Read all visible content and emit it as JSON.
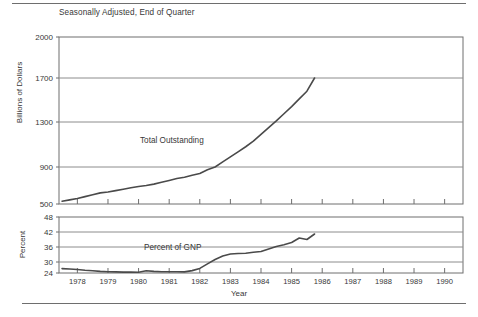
{
  "figure": {
    "subtitle": "Seasonally Adjusted, End of Quarter",
    "xlabel": "Year",
    "ylabel_top": "Billions of Dollars",
    "ylabel_bottom": "Percent",
    "line_color": "#4a4a4a",
    "axis_color": "#6e6e6e",
    "grid_color": "#8c8c8c",
    "text_color": "#383838"
  },
  "chart_data": [
    {
      "type": "line",
      "title": "Seasonally Adjusted, End of Quarter",
      "xlabel": "Year",
      "ylabel": "Billions of Dollars",
      "grid": true,
      "legend": "none",
      "annotations": [
        "Total Outstanding"
      ],
      "series_label": "Total Outstanding",
      "xlim": [
        1977.4,
        1990.6
      ],
      "xticks": [
        1978,
        1979,
        1980,
        1981,
        1982,
        1983,
        1984,
        1985,
        1986,
        1987,
        1988,
        1989,
        1990
      ],
      "xtick_labels": [
        "1978",
        "1979",
        "1980",
        "1981",
        "1982",
        "1983",
        "1984",
        "1985",
        "1986",
        "1987",
        "1988",
        "1989",
        "1990"
      ],
      "yticks": [
        500,
        900,
        1300,
        1700,
        2000
      ],
      "ytick_labels": [
        "500",
        "900",
        "1300",
        "1700",
        "2000"
      ],
      "ylim": [
        500,
        2000
      ],
      "x": [
        1977.5,
        1977.75,
        1978.0,
        1978.25,
        1978.5,
        1978.75,
        1979.0,
        1979.25,
        1979.5,
        1979.75,
        1980.0,
        1980.25,
        1980.5,
        1980.75,
        1981.0,
        1981.25,
        1981.5,
        1981.75,
        1982.0,
        1982.25,
        1982.5,
        1982.75,
        1983.0,
        1983.25,
        1983.5,
        1983.75,
        1984.0,
        1984.25,
        1984.5,
        1984.75,
        1985.0,
        1985.25,
        1985.5,
        1985.75
      ],
      "values": [
        530,
        545,
        560,
        580,
        600,
        620,
        630,
        645,
        660,
        675,
        690,
        700,
        715,
        735,
        755,
        775,
        790,
        810,
        830,
        870,
        900,
        945,
        990,
        1035,
        1080,
        1130,
        1190,
        1250,
        1310,
        1375,
        1440,
        1510,
        1580,
        1700
      ]
    },
    {
      "type": "line",
      "xlabel": "Year",
      "ylabel": "Percent",
      "grid": true,
      "legend": "none",
      "annotations": [
        "Percent of GNP"
      ],
      "series_label": "Percent of GNP",
      "xlim": [
        1977.4,
        1990.6
      ],
      "xticks": [
        1978,
        1979,
        1980,
        1981,
        1982,
        1983,
        1984,
        1985,
        1986,
        1987,
        1988,
        1989,
        1990
      ],
      "xtick_labels": [
        "1978",
        "1979",
        "1980",
        "1981",
        "1982",
        "1983",
        "1984",
        "1985",
        "1986",
        "1987",
        "1988",
        "1989",
        "1990"
      ],
      "yticks": [
        24,
        30,
        36,
        42,
        48
      ],
      "ytick_labels": [
        "24",
        "30",
        "36",
        "42",
        "48"
      ],
      "ylim": [
        22.5,
        48
      ],
      "x": [
        1977.5,
        1977.75,
        1978.0,
        1978.25,
        1978.5,
        1978.75,
        1979.0,
        1979.25,
        1979.5,
        1979.75,
        1980.0,
        1980.25,
        1980.5,
        1980.75,
        1981.0,
        1981.25,
        1981.5,
        1981.75,
        1982.0,
        1982.25,
        1982.5,
        1982.75,
        1983.0,
        1983.25,
        1983.5,
        1983.75,
        1984.0,
        1984.25,
        1984.5,
        1984.75,
        1985.0,
        1985.25,
        1985.5,
        1985.75
      ],
      "values": [
        26.4,
        26.2,
        25.9,
        25.5,
        25.2,
        24.9,
        24.7,
        24.6,
        24.5,
        24.5,
        24.4,
        25.2,
        24.9,
        24.7,
        24.7,
        24.7,
        24.6,
        25.3,
        26.5,
        29.0,
        31.0,
        32.4,
        33.2,
        33.4,
        33.5,
        33.9,
        34.2,
        35.2,
        36.2,
        36.9,
        37.8,
        39.6,
        39.0,
        41.2
      ]
    }
  ]
}
